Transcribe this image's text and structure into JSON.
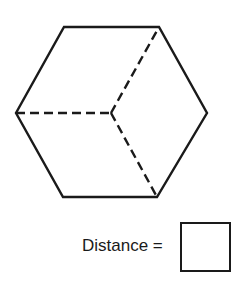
{
  "figure": {
    "shape": "hexagon (cube projection)",
    "vertices": [
      [
        64,
        27
      ],
      [
        159,
        27
      ],
      [
        207,
        113
      ],
      [
        157,
        197
      ],
      [
        63,
        197
      ],
      [
        16,
        113
      ]
    ],
    "center": [
      111,
      113
    ],
    "hidden_edges_to": [
      "left",
      "top-right",
      "bottom-right"
    ],
    "stroke_color": "#1a1a1a"
  },
  "answer": {
    "label": "Distance =",
    "value": ""
  }
}
